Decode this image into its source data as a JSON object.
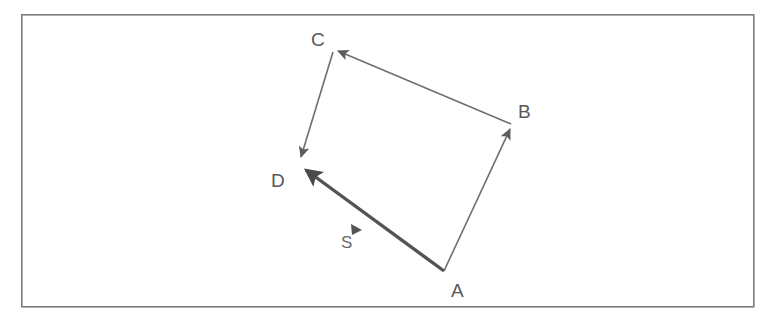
{
  "figure": {
    "background_color": "#ffffff",
    "frame": {
      "name": "outer-border",
      "x": 21,
      "y": 14,
      "width": 733,
      "height": 293,
      "stroke_color": "#7b7b7d",
      "stroke_width": 1.6
    },
    "vertices": [
      {
        "id": "A",
        "label": "A",
        "x": 444,
        "y": 272,
        "label_x": 451,
        "label_y": 297
      },
      {
        "id": "B",
        "label": "B",
        "x": 512,
        "y": 125,
        "label_x": 518,
        "label_y": 118
      },
      {
        "id": "C",
        "label": "C",
        "x": 333,
        "y": 50,
        "label_x": 311,
        "label_y": 46
      },
      {
        "id": "D",
        "label": "D",
        "x": 300,
        "y": 163,
        "label_x": 271,
        "label_y": 187
      }
    ],
    "vectors": [
      {
        "id": "AB",
        "from": "A",
        "to": "B",
        "label": "",
        "stroke_color": "#6e6e70",
        "stroke_width": 1.6,
        "arrowhead": "at-end",
        "emphasis": "normal"
      },
      {
        "id": "BC",
        "from": "B",
        "to": "C",
        "label": "",
        "stroke_color": "#6e6e70",
        "stroke_width": 1.6,
        "arrowhead": "at-end",
        "emphasis": "normal"
      },
      {
        "id": "CD",
        "from": "C",
        "to": "D",
        "label": "",
        "stroke_color": "#6e6e70",
        "stroke_width": 1.6,
        "arrowhead": "at-end",
        "emphasis": "normal"
      },
      {
        "id": "AD",
        "from": "A",
        "to": "D",
        "label": "S",
        "stroke_color": "#545456",
        "stroke_width": 3.4,
        "arrowhead": "at-end",
        "emphasis": "bold"
      }
    ],
    "annotations": [
      {
        "id": "S",
        "name": "resultant-vector-label",
        "label": "S",
        "label_x": 341,
        "label_y": 247,
        "marker": {
          "name": "direction-marker-triangle",
          "x": 357,
          "y": 230,
          "angle_deg": -57,
          "fill": "#545456"
        }
      }
    ],
    "colors": {
      "frame_stroke": "#7b7b7d",
      "thin_line": "#6e6e70",
      "bold_line": "#545456",
      "label_text": "#58585a",
      "background": "#ffffff"
    }
  }
}
